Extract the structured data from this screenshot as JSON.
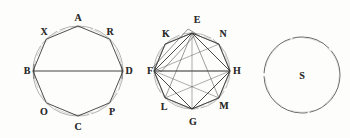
{
  "plate": {
    "title": "Geometric plate of three circular figures",
    "background_color": "#fdfdfb",
    "ink_color": "#2b2b2b",
    "faint_ink_color": "#8d8d8d"
  },
  "figures": [
    {
      "id": "figure-1",
      "kind": "octagon-in-circle",
      "center": {
        "x": 78,
        "y": 71
      },
      "radius": 45,
      "diameter_chord": {
        "from": "B",
        "to": "D"
      },
      "vertices": [
        {
          "label": "A",
          "angle_deg": 270,
          "label_x": 78,
          "label_y": 18
        },
        {
          "label": "R",
          "angle_deg": 315,
          "label_x": 110,
          "label_y": 32
        },
        {
          "label": "D",
          "angle_deg": 0,
          "label_x": 129,
          "label_y": 71
        },
        {
          "label": "P",
          "angle_deg": 45,
          "label_x": 112,
          "label_y": 112
        },
        {
          "label": "C",
          "angle_deg": 90,
          "label_x": 78,
          "label_y": 127
        },
        {
          "label": "O",
          "angle_deg": 135,
          "label_x": 44,
          "label_y": 112
        },
        {
          "label": "B",
          "angle_deg": 180,
          "label_x": 27,
          "label_y": 71
        },
        {
          "label": "X",
          "angle_deg": 225,
          "label_x": 44,
          "label_y": 32
        }
      ]
    },
    {
      "id": "figure-2",
      "kind": "octagon-in-circle-with-square",
      "center": {
        "x": 192,
        "y": 71
      },
      "radius": 38,
      "diameter_chord": {
        "from": "F",
        "to": "H"
      },
      "inner_square": [
        "E",
        "H",
        "G",
        "F"
      ],
      "vertices": [
        {
          "label": "E",
          "angle_deg": 270,
          "label_x": 197,
          "label_y": 20
        },
        {
          "label": "N",
          "angle_deg": 315,
          "label_x": 223,
          "label_y": 34
        },
        {
          "label": "H",
          "angle_deg": 0,
          "label_x": 237,
          "label_y": 71
        },
        {
          "label": "M",
          "angle_deg": 45,
          "label_x": 224,
          "label_y": 106
        },
        {
          "label": "G",
          "angle_deg": 90,
          "label_x": 193,
          "label_y": 122
        },
        {
          "label": "L",
          "angle_deg": 135,
          "label_x": 164,
          "label_y": 107
        },
        {
          "label": "F",
          "angle_deg": 180,
          "label_x": 150,
          "label_y": 71
        },
        {
          "label": "K",
          "angle_deg": 225,
          "label_x": 166,
          "label_y": 34
        }
      ]
    },
    {
      "id": "figure-3",
      "kind": "plain-circle",
      "center": {
        "x": 302,
        "y": 75
      },
      "radius": 38,
      "inner_label": {
        "text": "S",
        "x": 302,
        "y": 76
      }
    }
  ]
}
